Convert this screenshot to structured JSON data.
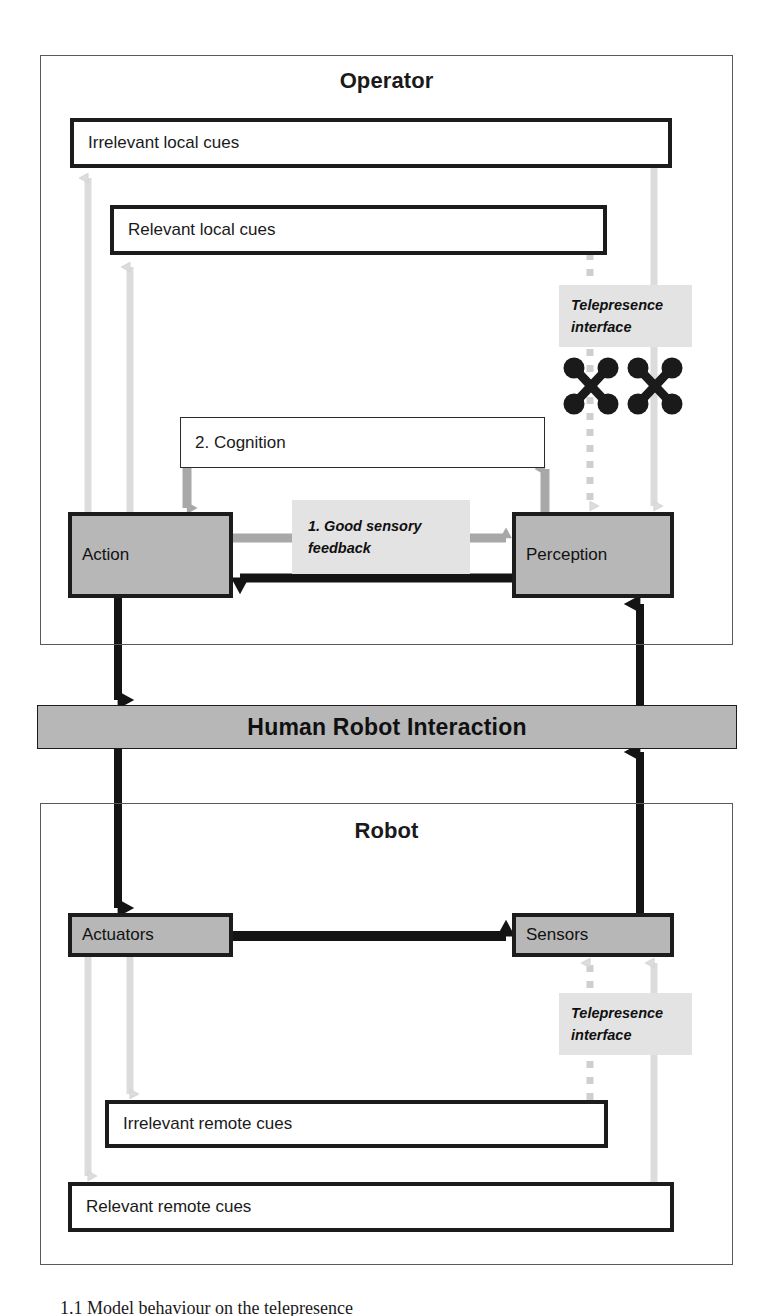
{
  "diagram": {
    "title_operator": "Operator",
    "title_robot": "Robot",
    "hri_bar_label": "Human Robot Interaction"
  },
  "operator": {
    "irrelevant_local_cues": "Irrelevant local cues",
    "relevant_local_cues": "Relevant local cues",
    "cognition": "2. Cognition",
    "action": "Action",
    "perception": "Perception",
    "good_sensory_feedback_line1": "1. Good sensory",
    "good_sensory_feedback_line2": "feedback",
    "telepresence_line1": "Telepresence",
    "telepresence_line2": "interface"
  },
  "robot": {
    "actuators": "Actuators",
    "sensors": "Sensors",
    "irrelevant_remote_cues": "Irrelevant remote cues",
    "relevant_remote_cues": "Relevant remote cues",
    "telepresence_line1": "Telepresence",
    "telepresence_line2": "interface"
  },
  "caption": {
    "text": "1.1 Model behaviour on the telepresence"
  },
  "colors": {
    "grey_fill": "#b7b7b7",
    "annotation_fill": "#e3e3e3",
    "heavy_border": "#1c1c1c",
    "light_arrow": "#d8d8d8",
    "mid_arrow": "#a8a8a8"
  },
  "icons": {
    "blocker_left": "x-blocker-icon",
    "blocker_right": "x-blocker-icon"
  }
}
